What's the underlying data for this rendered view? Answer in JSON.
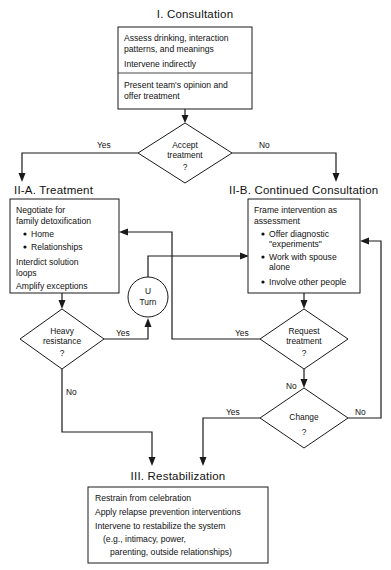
{
  "diagram": {
    "background_color": "#ffffff",
    "line_color": "#1a1a1a",
    "text_color": "#111111"
  },
  "stages": {
    "stage_one": {
      "heading": "I. Consultation",
      "box": {
        "upper_lines": [
          "Assess drinking, interaction",
          "patterns, and meanings",
          "Intervene indirectly"
        ],
        "lower_lines": [
          "Present team's opinion and",
          "offer treatment"
        ]
      }
    },
    "stage_two_a": {
      "heading": "II-A. Treatment",
      "box": {
        "lines": [
          "Negotiate for",
          "family detoxification"
        ],
        "bullets": [
          "Home",
          "Relationships"
        ],
        "lines_after": [
          "Interdict solution",
          "loops",
          "Amplify exceptions"
        ]
      }
    },
    "stage_two_b": {
      "heading": "II-B. Continued Consultation",
      "box": {
        "lines": [
          "Frame intervention as",
          "assessment"
        ],
        "bullets": [
          [
            "Offer diagnostic",
            "\"experiments\""
          ],
          [
            "Work with spouse",
            "alone"
          ],
          [
            "Involve other people"
          ]
        ]
      }
    },
    "stage_three": {
      "heading": "III. Restabilization",
      "box": {
        "lines": [
          "Restrain from celebration",
          "Apply relapse prevention interventions",
          "Intervene to restabilize the system",
          "(e.g., intimacy, power,",
          "parenting, outside relationships)"
        ]
      }
    }
  },
  "decisions": {
    "accept_treatment": {
      "line1": "Accept",
      "line2": "treatment",
      "line3": "?"
    },
    "heavy_resistance": {
      "line1": "Heavy",
      "line2": "resistance",
      "line3": "?"
    },
    "request_treatment": {
      "line1": "Request",
      "line2": "treatment",
      "line3": "?"
    },
    "change": {
      "line1": "Change",
      "line2": "?"
    }
  },
  "connector": {
    "u_turn": {
      "line1": "U",
      "line2": "Turn"
    }
  },
  "edge_labels": {
    "accept_yes": "Yes",
    "accept_no": "No",
    "resistance_yes": "Yes",
    "resistance_no": "No",
    "request_yes": "Yes",
    "request_no": "No",
    "change_yes": "Yes",
    "change_no": "No"
  }
}
